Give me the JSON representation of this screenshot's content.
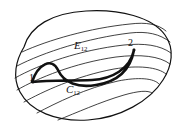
{
  "figure": {
    "kind": "mathematical-diagram",
    "background_color": "#ffffff",
    "stroke_color": "#111111",
    "labels": {
      "e12": {
        "base": "E",
        "sub": "12",
        "text": "E12"
      },
      "c12": {
        "base": "C",
        "sub": "12",
        "text": "C12"
      },
      "point_1": "1",
      "point_2": "2"
    },
    "strokes": {
      "boundary_width": 1.2,
      "leaf_width": 0.8,
      "thick_curve_width": 2.6
    },
    "geometry": {
      "boundary_path": "M 24 47 C 30 26, 52 13, 86 11 C 120 9, 152 17, 165 35 C 175 49, 172 66, 163 80 C 150 101, 120 118, 88 120 C 56 122, 30 111, 20 92 C 12 77, 16 60, 24 47 Z",
      "leaves": [
        "M 22 52 C 48 40, 90 28, 130 24 C 146 22, 158 24, 166 31",
        "M 17 66 C 44 52, 88 38, 130 33 C 147 31, 160 34, 170 42",
        "M 15 78 C 40 64, 80 50, 124 45 C 144 43, 160 45, 171 53",
        "M 17 90 C 38 78, 74 63, 116 57 C 140 54, 160 56, 170 64",
        "M 24 102 C 42 92, 76 76, 114 69 C 138 65, 158 67, 166 74",
        "M 37 113 C 56 103, 86 88, 118 81 C 138 77, 154 78, 159 84",
        "M 58 120 C 76 113, 100 102, 124 95 C 138 91, 148 90, 152 93"
      ],
      "thick_curve": "M 32 82 C 38 64, 52 57, 58 70 C 64 83, 78 88, 96 85 C 116 82, 130 72, 134 50 C 130 69, 112 79, 92 80 C 72 81, 50 80, 32 82 Z",
      "point_markers": [
        {
          "name": "1",
          "x": 33,
          "y": 82
        },
        {
          "name": "2",
          "x": 134,
          "y": 50
        }
      ]
    }
  }
}
